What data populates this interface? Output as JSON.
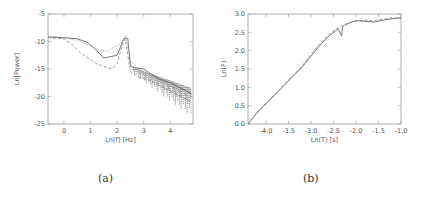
{
  "chart_data": [
    {
      "id": "a",
      "type": "line",
      "caption": "(a)",
      "title": "",
      "xlabel": "Ln[f] [Hz]",
      "ylabel": "Ln[Power]",
      "xlim": [
        -0.6,
        4.85
      ],
      "ylim": [
        -25,
        -5
      ],
      "xticks": [
        0,
        1,
        2,
        3,
        4
      ],
      "yticks": [
        -5,
        -10,
        -15,
        -20,
        -25
      ],
      "grid": false,
      "legend": null,
      "series": [
        {
          "name": "solid",
          "style": "solid",
          "x": [
            -0.6,
            0.0,
            0.5,
            0.9,
            1.2,
            1.5,
            1.7,
            2.0,
            2.2,
            2.3,
            2.4,
            2.5,
            2.7,
            3.0,
            3.3,
            3.6,
            4.0,
            4.4,
            4.8
          ],
          "y": [
            -9.2,
            -9.3,
            -9.5,
            -10.2,
            -11.5,
            -13.0,
            -12.8,
            -12.5,
            -10.0,
            -9.3,
            -9.5,
            -14.5,
            -14.8,
            -15.0,
            -16.0,
            -16.8,
            -17.5,
            -18.5,
            -19.5
          ]
        },
        {
          "name": "dotted",
          "style": "dotted",
          "x": [
            -0.6,
            0.0,
            0.5,
            1.0,
            1.3,
            1.6,
            1.9,
            2.1,
            2.3,
            2.5,
            2.8,
            3.2,
            3.6,
            4.0,
            4.4,
            4.8
          ],
          "y": [
            -9.0,
            -9.3,
            -9.8,
            -10.8,
            -11.5,
            -11.8,
            -11.0,
            -10.5,
            -9.0,
            -13.5,
            -15.0,
            -16.0,
            -17.0,
            -18.0,
            -19.0,
            -20.5
          ]
        },
        {
          "name": "dashed",
          "style": "dashed",
          "x": [
            -0.6,
            0.0,
            0.3,
            0.6,
            0.9,
            1.2,
            1.5,
            1.8,
            2.0,
            2.2,
            2.3,
            2.5,
            2.8,
            3.2,
            3.6,
            4.0,
            4.4,
            4.8
          ],
          "y": [
            -9.3,
            -9.5,
            -10.5,
            -12.0,
            -13.0,
            -14.0,
            -14.5,
            -15.0,
            -14.0,
            -10.5,
            -9.5,
            -15.5,
            -16.5,
            -17.0,
            -18.0,
            -19.0,
            -20.0,
            -21.0
          ]
        }
      ]
    },
    {
      "id": "b",
      "type": "line",
      "caption": "(b)",
      "title": "",
      "xlabel": "Ln(T) [s]",
      "ylabel": "Ln(F)",
      "xlim": [
        -4.4,
        -1.0
      ],
      "ylim": [
        0.0,
        3.0
      ],
      "xticks": [
        -4.0,
        -3.5,
        -3.0,
        -2.5,
        -2.0,
        -1.5,
        -1.0
      ],
      "yticks": [
        0.0,
        0.5,
        1.0,
        1.5,
        2.0,
        2.5,
        3.0
      ],
      "grid": false,
      "legend": null,
      "series": [
        {
          "name": "solid",
          "style": "solid",
          "x": [
            -4.4,
            -4.2,
            -4.0,
            -3.8,
            -3.6,
            -3.4,
            -3.2,
            -3.0,
            -2.8,
            -2.6,
            -2.4,
            -2.32,
            -2.3,
            -2.25,
            -2.1,
            -2.0,
            -1.8,
            -1.6,
            -1.4,
            -1.2,
            -1.0
          ],
          "y": [
            0.0,
            0.3,
            0.55,
            0.8,
            1.05,
            1.3,
            1.55,
            1.85,
            2.15,
            2.4,
            2.6,
            2.4,
            2.65,
            2.7,
            2.78,
            2.82,
            2.8,
            2.78,
            2.83,
            2.87,
            2.9
          ]
        },
        {
          "name": "dashed",
          "style": "dashed",
          "x": [
            -4.4,
            -4.2,
            -4.0,
            -3.8,
            -3.6,
            -3.4,
            -3.2,
            -3.0,
            -2.8,
            -2.6,
            -2.4,
            -2.2,
            -2.0,
            -1.8,
            -1.6,
            -1.4,
            -1.2,
            -1.0
          ],
          "y": [
            0.0,
            0.32,
            0.57,
            0.82,
            1.08,
            1.32,
            1.58,
            1.9,
            2.2,
            2.45,
            2.62,
            2.74,
            2.8,
            2.83,
            2.82,
            2.86,
            2.9,
            2.88
          ]
        }
      ]
    }
  ]
}
